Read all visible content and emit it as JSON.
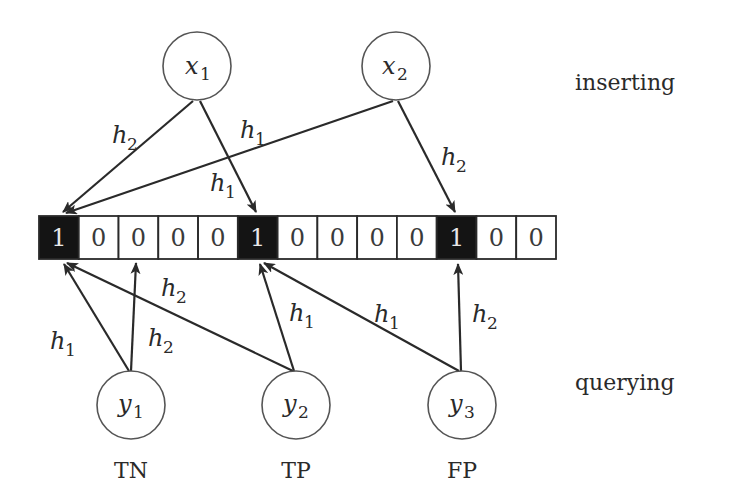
{
  "diagram": {
    "colors": {
      "stroke": "#2a2a2a",
      "bit_set_fill": "#141414",
      "bit_unset_fill": "#ffffff",
      "bit_set_text": "#e8e8e8",
      "bit_unset_text": "#3a3a3a",
      "background": "#ffffff"
    },
    "phase_labels": {
      "top": "inserting",
      "bottom": "querying"
    },
    "bit_array": {
      "values": [
        "1",
        "0",
        "0",
        "0",
        "0",
        "1",
        "0",
        "0",
        "0",
        "0",
        "1",
        "0",
        "0"
      ]
    },
    "insert_nodes": [
      {
        "id": "x1",
        "var": "x",
        "sub": "1"
      },
      {
        "id": "x2",
        "var": "x",
        "sub": "2"
      }
    ],
    "query_nodes": [
      {
        "id": "y1",
        "var": "y",
        "sub": "1",
        "outcome": "TN"
      },
      {
        "id": "y2",
        "var": "y",
        "sub": "2",
        "outcome": "TP"
      },
      {
        "id": "y3",
        "var": "y",
        "sub": "3",
        "outcome": "FP"
      }
    ],
    "edges": [
      {
        "from": "x1",
        "to_bit": 0,
        "hash": "h",
        "hash_sub": "2"
      },
      {
        "from": "x1",
        "to_bit": 5,
        "hash": "h",
        "hash_sub": "1"
      },
      {
        "from": "x2",
        "to_bit": 0,
        "hash": "h",
        "hash_sub": "1"
      },
      {
        "from": "x2",
        "to_bit": 10,
        "hash": "h",
        "hash_sub": "2"
      },
      {
        "from": "y1",
        "to_bit": 0,
        "hash": "h",
        "hash_sub": "1"
      },
      {
        "from": "y1",
        "to_bit": 2,
        "hash": "h",
        "hash_sub": "2"
      },
      {
        "from": "y2",
        "to_bit": 0,
        "hash": "h",
        "hash_sub": "2"
      },
      {
        "from": "y2",
        "to_bit": 5,
        "hash": "h",
        "hash_sub": "1"
      },
      {
        "from": "y3",
        "to_bit": 5,
        "hash": "h",
        "hash_sub": "1"
      },
      {
        "from": "y3",
        "to_bit": 10,
        "hash": "h",
        "hash_sub": "2"
      }
    ]
  }
}
